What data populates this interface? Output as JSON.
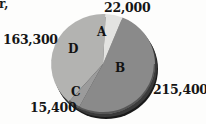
{
  "figure": {
    "cropped_caption_fragment": "r,",
    "background_color": "#fdfdfc",
    "text_color": "#151515"
  },
  "chart_data": {
    "type": "pie",
    "title": "",
    "subtitle": "",
    "xlabel": "",
    "ylabel": "",
    "legend_position": "none",
    "grid": false,
    "style": "3d-grayscale",
    "labels": [
      "A",
      "B",
      "C",
      "D"
    ],
    "categories": [
      "A",
      "B",
      "C",
      "D"
    ],
    "values": [
      22000,
      215400,
      15400,
      163300
    ],
    "value_labels": [
      "22,000",
      "215,400",
      "15,400",
      "163,300"
    ],
    "total": 416100,
    "colors": [
      "#e3e3e1",
      "#8a8a8a",
      "#9b9b9b",
      "#b3b3b1"
    ],
    "slices": [
      {
        "label": "A",
        "value": 22000,
        "value_label": "22,000",
        "color": "#e3e3e1",
        "start_angle_deg": 3,
        "end_angle_deg": 22,
        "callout_position": "top"
      },
      {
        "label": "B",
        "value": 215400,
        "value_label": "215,400",
        "color": "#8a8a8a",
        "start_angle_deg": 22,
        "end_angle_deg": 208,
        "callout_position": "right"
      },
      {
        "label": "C",
        "value": 15400,
        "value_label": "15,400",
        "color": "#9b9b9b",
        "start_angle_deg": 208,
        "end_angle_deg": 221,
        "callout_position": "bottom-left"
      },
      {
        "label": "D",
        "value": 163300,
        "value_label": "163,300",
        "color": "#b3b3b1",
        "start_angle_deg": 221,
        "end_angle_deg": 363,
        "callout_position": "left"
      }
    ]
  }
}
